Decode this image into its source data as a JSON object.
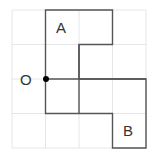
{
  "diagram": {
    "grid": {
      "cols": 4,
      "rows": 4,
      "color": "#e6e6e6"
    },
    "shape_color": "#555555",
    "labels": {
      "a": "A",
      "b": "B",
      "o": "O"
    },
    "point_color": "#000000"
  }
}
